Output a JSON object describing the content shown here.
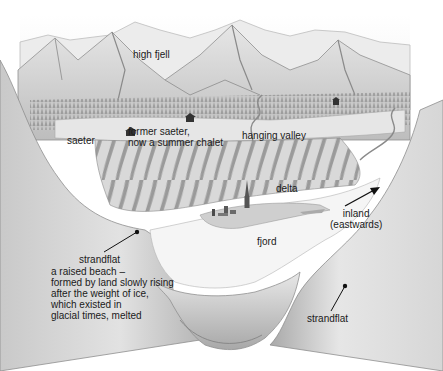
{
  "diagram": {
    "type": "landscape cross-section illustration",
    "labels": {
      "high_fjell": "high fjell",
      "saeter": "saeter",
      "former_saeter": "former saeter,\nnow a summer chalet",
      "hanging_valley": "hanging valley",
      "delta": "delta",
      "inland": "inland\n(eastwards)",
      "fjord": "fjord",
      "strandflat_left_title": "strandflat",
      "strandflat_left_desc": "a raised beach –\nformed by land slowly rising\nafter the weight of ice,\nwhich existed in\nglacial times, melted",
      "strandflat_right": "strandflat"
    },
    "colors": {
      "background": "#ffffff",
      "pencil_dark": "#8a8a8a",
      "pencil_mid": "#b8b8b8",
      "pencil_light": "#dcdcdc",
      "water": "#f4f4f4",
      "text": "#1a1a1a"
    }
  }
}
